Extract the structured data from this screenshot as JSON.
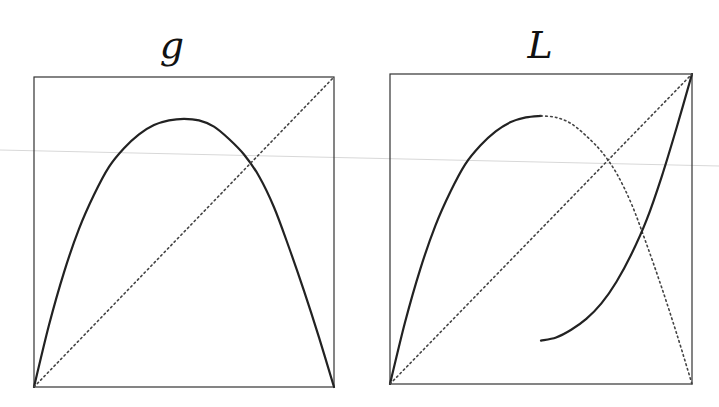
{
  "chart_data": [
    {
      "type": "line",
      "title": "g",
      "xlabel": "",
      "ylabel": "",
      "xlim": [
        0,
        1
      ],
      "ylim": [
        0,
        1
      ],
      "grid": false,
      "series": [
        {
          "name": "g",
          "style": "solid",
          "x": [
            0,
            0.05,
            0.1,
            0.15,
            0.2,
            0.25,
            0.3,
            0.35,
            0.4,
            0.45,
            0.5,
            0.55,
            0.6,
            0.65,
            0.7,
            0.75,
            0.8,
            0.85,
            0.9,
            0.95,
            1
          ],
          "y": [
            0,
            0.2,
            0.37,
            0.51,
            0.62,
            0.71,
            0.77,
            0.815,
            0.845,
            0.86,
            0.865,
            0.86,
            0.84,
            0.8,
            0.75,
            0.68,
            0.58,
            0.45,
            0.31,
            0.16,
            0
          ]
        },
        {
          "name": "identity",
          "style": "dotted",
          "x": [
            0,
            1
          ],
          "y": [
            0,
            1
          ]
        }
      ]
    },
    {
      "type": "line",
      "title": "L",
      "xlabel": "",
      "ylabel": "",
      "xlim": [
        0,
        1
      ],
      "ylim": [
        0,
        1
      ],
      "grid": false,
      "series": [
        {
          "name": "L-left-branch",
          "style": "solid",
          "x": [
            0,
            0.05,
            0.1,
            0.15,
            0.2,
            0.25,
            0.3,
            0.35,
            0.4,
            0.45,
            0.5
          ],
          "y": [
            0,
            0.2,
            0.37,
            0.51,
            0.62,
            0.71,
            0.77,
            0.815,
            0.845,
            0.86,
            0.865
          ]
        },
        {
          "name": "g-continuation",
          "style": "dotted",
          "x": [
            0.5,
            0.55,
            0.6,
            0.65,
            0.7,
            0.75,
            0.8,
            0.85,
            0.9,
            0.95,
            1
          ],
          "y": [
            0.865,
            0.86,
            0.84,
            0.8,
            0.75,
            0.68,
            0.58,
            0.45,
            0.31,
            0.16,
            0
          ]
        },
        {
          "name": "L-right-branch",
          "style": "solid",
          "x": [
            0.5,
            0.55,
            0.6,
            0.65,
            0.7,
            0.75,
            0.8,
            0.85,
            0.9,
            0.95,
            1
          ],
          "y": [
            0.14,
            0.15,
            0.175,
            0.21,
            0.26,
            0.33,
            0.42,
            0.53,
            0.67,
            0.83,
            1
          ]
        },
        {
          "name": "identity",
          "style": "dotted",
          "x": [
            0,
            1
          ],
          "y": [
            0,
            1
          ]
        }
      ]
    }
  ]
}
